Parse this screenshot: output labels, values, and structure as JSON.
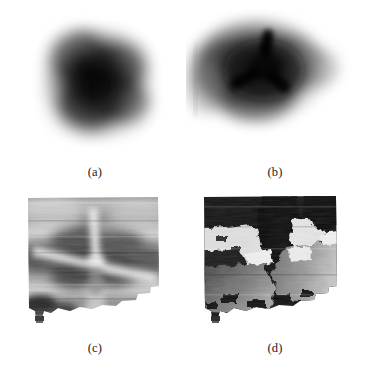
{
  "figure": {
    "background_color": "#ffffff",
    "ink_color": "#1a1a1a",
    "layout": "2x2 grid of grayscale image panels with lettered captions beneath each panel",
    "panel_count": 4
  },
  "panels": [
    {
      "id": "a",
      "label": "(a)",
      "kind": "grayscale-intensity-map",
      "description": "Soft blurred dark roughly-square blob on white background, darkest near the centre, edges fading smoothly to white",
      "core_shape": "diffuse-round-blob",
      "has_tri_radial_core": false,
      "edge": "smooth-gaussian-falloff",
      "min_gray": "#0d0d0d",
      "max_gray": "#ffffff",
      "grain": "fine speckle"
    },
    {
      "id": "b",
      "label": "(b)",
      "kind": "grayscale-intensity-map",
      "description": "Blurred dark blob containing a sharp three-armed (Y-shaped) dark core: one arm pointing up, two arms pointing down-left and down-right",
      "core_shape": "tri-radial-dark-Y",
      "has_tri_radial_core": true,
      "arm_angles_deg": [
        90,
        210,
        330
      ],
      "edge": "smooth-gaussian-falloff",
      "min_gray": "#050505",
      "max_gray": "#ffffff",
      "grain": "fine speckle"
    },
    {
      "id": "c",
      "label": "(c)",
      "kind": "grayscale-phase-map-unwrapped",
      "description": "Textured grayscale map with broad horizontal banding and a bright three-armed star radiating from the centre, dark lobes between the arms; outline is a rectangle with a ragged lower-right border and a small tab at lower left",
      "core_shape": "tri-radial-bright-Y",
      "has_tri_radial_core": true,
      "arm_angles_deg": [
        90,
        210,
        330
      ],
      "edge": "ragged-irregular-boundary",
      "min_gray": "#101010",
      "max_gray": "#f2f2f2",
      "grain": "strong horizontal streak texture"
    },
    {
      "id": "d",
      "label": "(d)",
      "kind": "grayscale-phase-map-wrapped",
      "description": "High-contrast wrapped-phase map with sharp domain boundaries separating near-black, mid-grey and near-white regions; same ragged outline as panel (c)",
      "core_shape": "sharp-phase-domains",
      "has_tri_radial_core": true,
      "arm_angles_deg": [
        90,
        210,
        330
      ],
      "edge": "ragged-irregular-boundary",
      "min_gray": "#060606",
      "max_gray": "#fafafa",
      "grain": "blocky quantised domains"
    }
  ]
}
